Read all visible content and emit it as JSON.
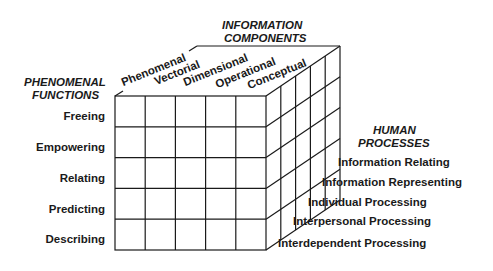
{
  "diagram": {
    "type": "3d-cube-matrix",
    "axes": {
      "information_components": {
        "title_line1": "INFORMATION",
        "title_line2": "COMPONENTS",
        "items": [
          "Phenomenal",
          "Vectorial",
          "Dimensional",
          "Operational",
          "Conceptual"
        ]
      },
      "phenomenal_functions": {
        "title_line1": "PHENOMENAL",
        "title_line2": "FUNCTIONS",
        "items": [
          "Freeing",
          "Empowering",
          "Relating",
          "Predicting",
          "Describing"
        ]
      },
      "human_processes": {
        "title_line1": "HUMAN",
        "title_line2": "PROCESSES",
        "items": [
          "Information Relating",
          "Information Representing",
          "Individual Processing",
          "Interpersonal Processing",
          "Interdependent Processing"
        ]
      }
    },
    "grid": {
      "columns": 5,
      "rows": 5,
      "depth": 5
    },
    "colors": {
      "line": "#1a1a1a",
      "text": "#1a1a1a",
      "background": "#ffffff"
    }
  }
}
